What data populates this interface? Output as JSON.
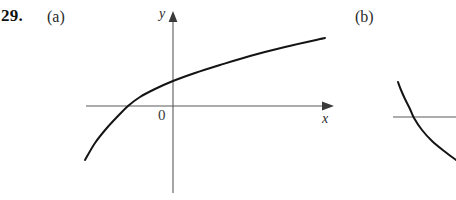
{
  "figure": {
    "problem_number": "29.",
    "part_a_label": "(a)",
    "part_b_label": "(b)",
    "background_color": "#ffffff",
    "ink_color": "#141414",
    "axis_color": "#5a5a5a"
  },
  "panel_a": {
    "y_axis_label": "y",
    "x_axis_label": "x",
    "origin_label": "0"
  },
  "panel_b": {
    "note": ""
  },
  "chart_data": [
    {
      "type": "line",
      "title": "(a)",
      "xlabel": "x",
      "ylabel": "y",
      "origin_label": "0",
      "grid": false,
      "legend": null,
      "axes": {
        "x_axis_pixel_y": 106,
        "y_axis_pixel_x": 173,
        "x_axis_from": 86,
        "x_axis_to": 330,
        "y_axis_from": 14,
        "y_axis_to": 193,
        "x_arrow": true,
        "y_arrow": true
      },
      "description": "increasing concave-down logarithm-like curve crossing the x-axis left of the origin",
      "points": [
        {
          "x": 85,
          "y": 160
        },
        {
          "x": 95,
          "y": 143
        },
        {
          "x": 106,
          "y": 129
        },
        {
          "x": 118,
          "y": 116
        },
        {
          "x": 128,
          "y": 106
        },
        {
          "x": 140,
          "y": 97
        },
        {
          "x": 155,
          "y": 89
        },
        {
          "x": 173,
          "y": 81
        },
        {
          "x": 195,
          "y": 73
        },
        {
          "x": 220,
          "y": 65
        },
        {
          "x": 250,
          "y": 56
        },
        {
          "x": 285,
          "y": 47
        },
        {
          "x": 325,
          "y": 38
        }
      ],
      "x_intercept_pixel": 128,
      "y_intercept_pixel": 81
    },
    {
      "type": "line",
      "title": "(b)",
      "xlabel": "",
      "ylabel": "",
      "grid": false,
      "legend": null,
      "axes": {
        "x_axis_pixel_y": 117,
        "x_axis_from": 393,
        "x_axis_to": 456,
        "x_arrow": false,
        "y_arrow": false
      },
      "description": "decreasing convex curve, partially cropped at right edge, crossing the horizontal axis",
      "points": [
        {
          "x": 398,
          "y": 82
        },
        {
          "x": 401,
          "y": 90
        },
        {
          "x": 405,
          "y": 99
        },
        {
          "x": 410,
          "y": 109
        },
        {
          "x": 414,
          "y": 118
        },
        {
          "x": 422,
          "y": 130
        },
        {
          "x": 432,
          "y": 141
        },
        {
          "x": 444,
          "y": 151
        },
        {
          "x": 456,
          "y": 160
        }
      ],
      "x_intercept_pixel": 413
    }
  ]
}
